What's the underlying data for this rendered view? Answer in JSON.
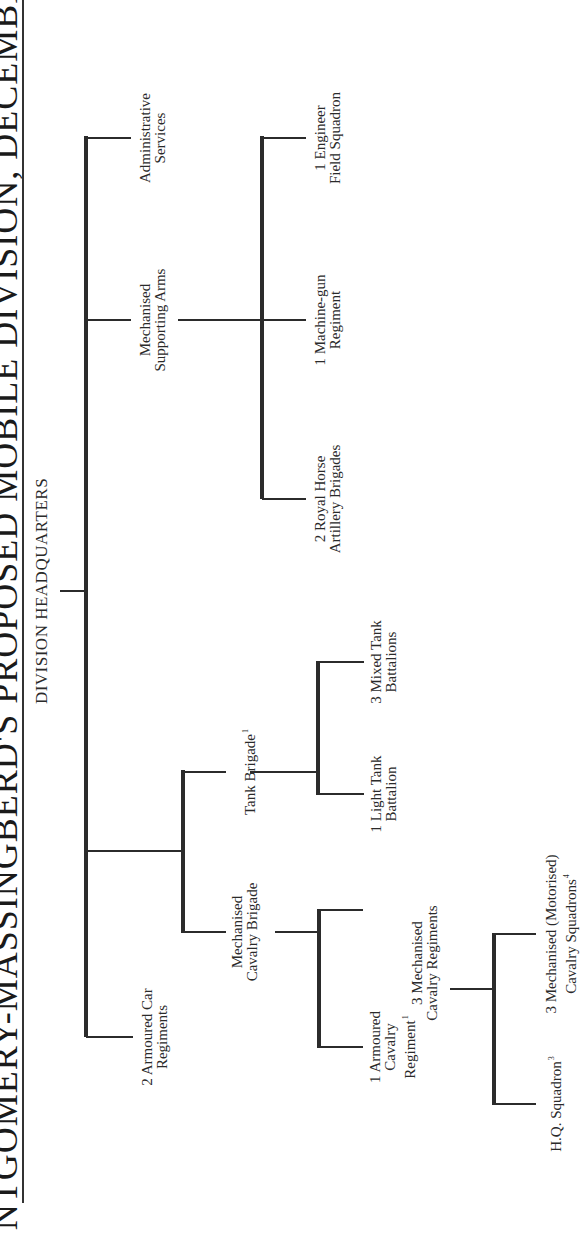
{
  "title": "NTGOMERY-MASSINGBERD'S PROPOSED MOBILE DIVISION, DECEMBER",
  "orientation": "rotated 90° counter-clockwise",
  "root": {
    "label": "DIVISION HEADQUARTERS"
  },
  "level1": {
    "armoured_car": {
      "line1": "2  Armoured  Car",
      "line2": "Regiments"
    },
    "mech_cav_brigade": {
      "line1": "Mechanised",
      "line2": "Cavalry  Brigade"
    },
    "tank_brigade": {
      "line1": "Tank  Brigade",
      "sup": "1"
    },
    "mech_support": {
      "line1": "Mechanised",
      "line2": "Supporting  Arms"
    },
    "admin": {
      "line1": "Administrative",
      "line2": "Services"
    }
  },
  "mech_cav_children": {
    "armoured_cav": {
      "line1": "1  Armoured",
      "line2": "Cavalry",
      "line3": "Regiment",
      "sup": "1"
    },
    "mech_cav_regts": {
      "line1": "3  Mechanised",
      "line2": "Cavalry  Regiments"
    }
  },
  "tank_children": {
    "light_tank": {
      "line1": "1  Light  Tank",
      "line2": "Battalion"
    },
    "mixed_tank": {
      "line1": "3  Mixed  Tank",
      "line2": "Battalions"
    }
  },
  "support_children": {
    "rha": {
      "line1": "2  Royal  Horse",
      "line2": "Artillery  Brigades"
    },
    "mg": {
      "line1": "1  Machine-gun",
      "line2": "Regiment"
    },
    "engineer": {
      "line1": "1  Engineer",
      "line2": "Field  Squadron"
    }
  },
  "regiment_children": {
    "hq_squadron": {
      "line1": "H.Q.  Squadron",
      "sup": "3"
    },
    "mech_squadrons": {
      "line1": "3  Mechanised  (Motorised)",
      "line2": "Cavalry  Squadrons",
      "sup": "4"
    }
  }
}
